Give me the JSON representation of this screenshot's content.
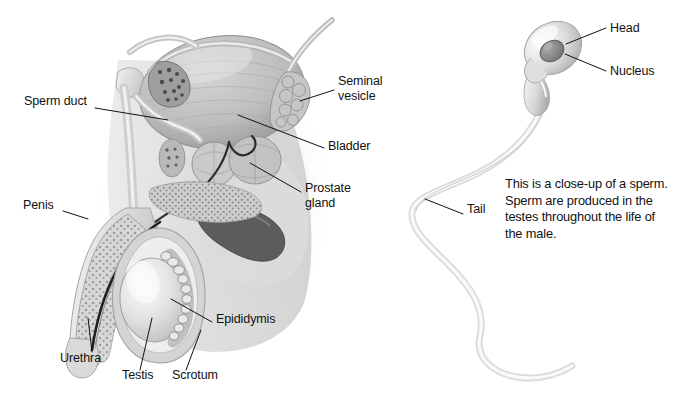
{
  "figure": {
    "background_color": "#ffffff",
    "ink_color": "#111111",
    "panels": [
      {
        "name": "male-reproductive-system-cross-section",
        "side": "left"
      },
      {
        "name": "sperm-cell-close-up",
        "side": "right"
      }
    ]
  },
  "anatomy_labels": [
    {
      "id": "sperm-duct",
      "text": "Sperm duct",
      "x": 24,
      "y": 101,
      "align": "left",
      "leader": "M95,108 L168,120"
    },
    {
      "id": "seminal-vesicle",
      "text": "Seminal\nvesicle",
      "x": 338,
      "y": 81,
      "align": "left",
      "leader": "M334,90 L300,101"
    },
    {
      "id": "bladder",
      "text": "Bladder",
      "x": 328,
      "y": 146,
      "align": "left",
      "leader": "M324,148 L238,115"
    },
    {
      "id": "prostate-gland",
      "text": "Prostate\ngland",
      "x": 305,
      "y": 188,
      "align": "left",
      "leader": "M301,192 L250,163"
    },
    {
      "id": "penis",
      "text": "Penis",
      "x": 23,
      "y": 205,
      "align": "left",
      "leader": "M63,211 L88,219"
    },
    {
      "id": "epididymis",
      "text": "Epididymis",
      "x": 216,
      "y": 319,
      "align": "left",
      "leader": "M212,322 L171,299"
    },
    {
      "id": "urethra",
      "text": "Urethra",
      "x": 60,
      "y": 358,
      "align": "left",
      "leader": "M92,352 L88,318"
    },
    {
      "id": "testis",
      "text": "Testis",
      "x": 122,
      "y": 375,
      "align": "left",
      "leader": "M140,370 L152,318"
    },
    {
      "id": "scrotum",
      "text": "Scrotum",
      "x": 172,
      "y": 375,
      "align": "left",
      "leader": "M186,370 L201,330"
    }
  ],
  "sperm_labels": [
    {
      "id": "head",
      "text": "Head",
      "x": 610,
      "y": 21,
      "align": "left",
      "leader": "M606,28 L566,44"
    },
    {
      "id": "nucleus",
      "text": "Nucleus",
      "x": 610,
      "y": 64,
      "align": "left",
      "leader": "M606,71 L565,54"
    },
    {
      "id": "tail",
      "text": "Tail",
      "x": 467,
      "y": 209,
      "align": "left",
      "leader": "M463,214 L425,199"
    }
  ],
  "caption": {
    "id": "sperm-caption",
    "lines": [
      "This is a close-up of a sperm.",
      "Sperm are produced in the",
      "testes throughout the life of",
      "the male."
    ],
    "text": "This is a close-up of a sperm. Sperm are produced in the testes throughout the life of the male."
  }
}
